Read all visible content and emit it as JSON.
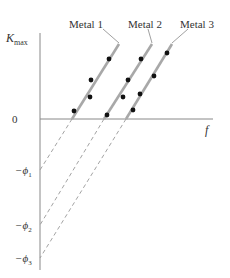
{
  "axes": {
    "y_label": "K",
    "y_label_sub": "max",
    "x_label": "f",
    "origin_label": "0",
    "intercepts": [
      {
        "label": "−ϕ",
        "sub": "1"
      },
      {
        "label": "−ϕ",
        "sub": "2"
      },
      {
        "label": "−ϕ",
        "sub": "3"
      }
    ]
  },
  "series": [
    {
      "name": "Metal 1"
    },
    {
      "name": "Metal 2"
    },
    {
      "name": "Metal 3"
    }
  ],
  "colors": {
    "axis": "#888888",
    "line": "#a8a8a8",
    "dashed": "#999999",
    "dot": "#111111",
    "text": "#333333"
  }
}
